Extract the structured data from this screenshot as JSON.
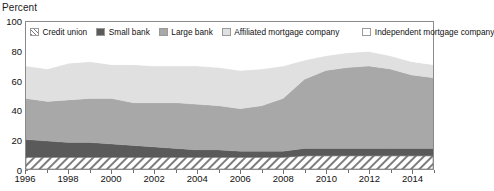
{
  "axis_title": "Percent",
  "legend": {
    "items": [
      {
        "label": "Credit union",
        "swatch": "hatch",
        "color": "#ffffff",
        "pattern": "diagonal-hatch"
      },
      {
        "label": "Small bank",
        "swatch": "solid",
        "color": "#5a5a5a"
      },
      {
        "label": "Large bank",
        "swatch": "solid",
        "color": "#a8a8a8"
      },
      {
        "label": "Affiliated mortgage company",
        "swatch": "solid",
        "color": "#e0e0e0"
      },
      {
        "label": "Independent mortgage company",
        "swatch": "solid",
        "color": "#ffffff"
      }
    ]
  },
  "chart_data": {
    "type": "area",
    "stacked": true,
    "title": "",
    "xlabel": "",
    "ylabel": "Percent",
    "ylim": [
      0,
      100
    ],
    "xlim": [
      1996,
      2015
    ],
    "grid": false,
    "legend_position": "top-inside",
    "yticks": [
      0,
      20,
      40,
      60,
      80,
      100
    ],
    "xticks": [
      1996,
      1998,
      2000,
      2002,
      2004,
      2006,
      2008,
      2010,
      2012,
      2014
    ],
    "x": [
      1996,
      1997,
      1998,
      1999,
      2000,
      2001,
      2002,
      2003,
      2004,
      2005,
      2006,
      2007,
      2008,
      2009,
      2010,
      2011,
      2012,
      2013,
      2014,
      2015
    ],
    "series": [
      {
        "name": "Credit union",
        "color": "#ffffff",
        "pattern": "diagonal-hatch",
        "values": [
          8,
          8,
          8,
          8,
          8,
          8,
          8,
          8,
          8,
          8,
          8,
          8,
          8,
          9,
          9,
          9,
          9,
          9,
          9,
          9
        ]
      },
      {
        "name": "Small bank",
        "color": "#5a5a5a",
        "values": [
          12,
          11,
          10,
          10,
          9,
          8,
          7,
          6,
          5,
          5,
          4,
          4,
          4,
          5,
          5,
          5,
          5,
          5,
          5,
          5
        ]
      },
      {
        "name": "Large bank",
        "color": "#a8a8a8",
        "values": [
          28,
          27,
          29,
          30,
          31,
          29,
          30,
          31,
          31,
          30,
          29,
          31,
          36,
          47,
          53,
          55,
          56,
          54,
          50,
          48
        ]
      },
      {
        "name": "Affiliated mortgage company",
        "color": "#e0e0e0",
        "values": [
          22,
          22,
          25,
          25,
          23,
          26,
          25,
          25,
          26,
          26,
          26,
          25,
          22,
          13,
          10,
          10,
          10,
          9,
          9,
          9
        ]
      },
      {
        "name": "Independent mortgage company",
        "color": "#ffffff",
        "values": [
          30,
          32,
          28,
          27,
          29,
          29,
          30,
          30,
          30,
          31,
          33,
          32,
          30,
          26,
          23,
          21,
          20,
          23,
          27,
          29
        ]
      }
    ]
  }
}
